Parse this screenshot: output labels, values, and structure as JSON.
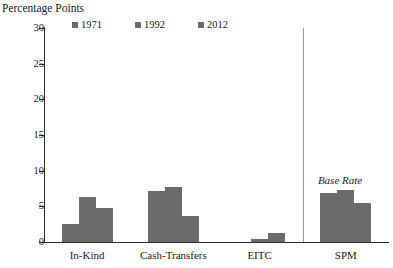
{
  "chart_data": {
    "type": "bar",
    "title": "",
    "xlabel": "",
    "ylabel": "Percentage Points",
    "ylim": [
      0,
      30
    ],
    "yticks": [
      0,
      5,
      10,
      15,
      20,
      25,
      30
    ],
    "ytick_labels": [
      "0",
      "5",
      "10",
      "15",
      "20",
      "25",
      "30"
    ],
    "grid": false,
    "legend_position": "top-left",
    "categories": [
      "In-Kind",
      "Cash-Transfers",
      "EITC",
      "SPM"
    ],
    "series": [
      {
        "name": "1971",
        "values": [
          2.5,
          7.1,
          0.0,
          6.9
        ]
      },
      {
        "name": "1992",
        "values": [
          6.3,
          7.7,
          0.4,
          7.3
        ]
      },
      {
        "name": "2012",
        "values": [
          4.7,
          3.6,
          1.2,
          5.4
        ]
      }
    ],
    "annotations": [
      {
        "text": "Base Rate",
        "style": "italic",
        "x_category": "SPM",
        "y_value": 9.5
      }
    ],
    "separators": [
      {
        "after_category": "EITC",
        "orientation": "vertical"
      }
    ],
    "colors": {
      "bar": "#6b6b6b",
      "axis": "#2b2b2b",
      "separator": "#9a9a9a",
      "text": "#1a1a1a",
      "background": "#ffffff"
    }
  }
}
